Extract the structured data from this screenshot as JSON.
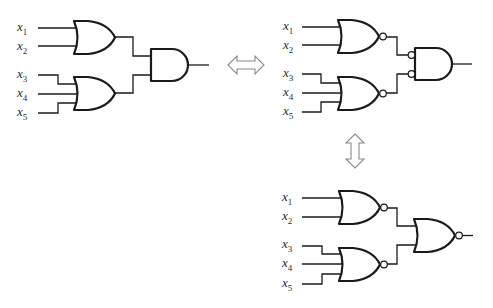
{
  "diagram": {
    "circuits": [
      {
        "id": "or-and",
        "inputs": [
          {
            "var": "x",
            "sub": "1"
          },
          {
            "var": "x",
            "sub": "2"
          },
          {
            "var": "x",
            "sub": "3"
          },
          {
            "var": "x",
            "sub": "4"
          },
          {
            "var": "x",
            "sub": "5"
          }
        ],
        "first_level": [
          "OR",
          "OR"
        ],
        "second_level": "AND"
      },
      {
        "id": "nor-and-inverted-inputs",
        "inputs": [
          {
            "var": "x",
            "sub": "1"
          },
          {
            "var": "x",
            "sub": "2"
          },
          {
            "var": "x",
            "sub": "3"
          },
          {
            "var": "x",
            "sub": "4"
          },
          {
            "var": "x",
            "sub": "5"
          }
        ],
        "first_level": [
          "NOR",
          "NOR"
        ],
        "second_level": "AND with inverted inputs"
      },
      {
        "id": "nor-nor",
        "inputs": [
          {
            "var": "x",
            "sub": "1"
          },
          {
            "var": "x",
            "sub": "2"
          },
          {
            "var": "x",
            "sub": "3"
          },
          {
            "var": "x",
            "sub": "4"
          },
          {
            "var": "x",
            "sub": "5"
          }
        ],
        "first_level": [
          "NOR",
          "NOR"
        ],
        "second_level": "NOR"
      }
    ],
    "equivalences": [
      {
        "from": "or-and",
        "to": "nor-and-inverted-inputs",
        "icon": "double-arrow-horizontal-icon"
      },
      {
        "from": "nor-and-inverted-inputs",
        "to": "nor-nor",
        "icon": "double-arrow-vertical-icon"
      }
    ],
    "colors": {
      "line": "#1a1a1a",
      "arrow": "#8a8a8a",
      "background": "#ffffff"
    }
  }
}
